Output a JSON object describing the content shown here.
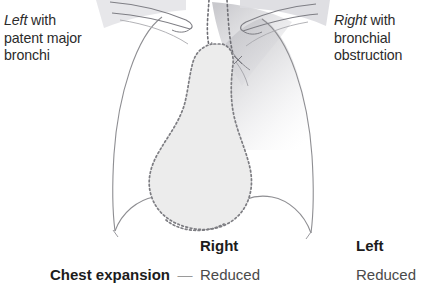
{
  "figure": {
    "type": "chest-radiograph-schematic",
    "background_color": "#ffffff",
    "outline_color": "#8e8e92",
    "mediastinum_fill": "#ececec",
    "mediastinum_border_color": "#7d7d82",
    "opacity_shadow_color": "#b9b9bd",
    "alt": "Schematic chest radiograph showing mediastinal shift toward the right with bronchial obstruction and a patent left major bronchus"
  },
  "annotations": {
    "left": {
      "side": "Left",
      "rest_line1": " with",
      "line2": "patent major",
      "line3": "bronchi"
    },
    "right": {
      "side": "Right",
      "rest_line1": " with",
      "line2": "bronchial",
      "line3": "obstruction"
    }
  },
  "findings": {
    "headers": {
      "right": "Right",
      "left": "Left"
    },
    "rows": [
      {
        "label": "Chest expansion",
        "dash": "—",
        "right": "Reduced",
        "left": "Reduced"
      }
    ]
  }
}
